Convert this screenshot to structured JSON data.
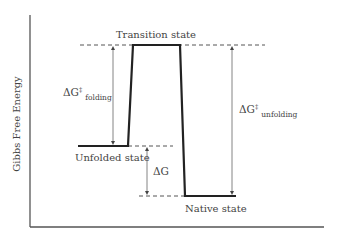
{
  "diagram": {
    "title": "",
    "y_axis_label": "Gibbs Free Energy",
    "states": {
      "transition": "Transition state",
      "unfolded": "Unfolded state",
      "native": "Native state"
    },
    "energies": {
      "dg_folding": {
        "symbol": "ΔG",
        "superscript": "‡",
        "subscript": "folding"
      },
      "dg_unfolding": {
        "symbol": "ΔG",
        "superscript": "‡",
        "subscript": "unfolding"
      },
      "dg": {
        "symbol": "ΔG"
      }
    },
    "colors": {
      "axis": "#555555",
      "profile": "#222222",
      "arrow": "#666666",
      "dashed": "#555555",
      "text": "#444444"
    }
  }
}
